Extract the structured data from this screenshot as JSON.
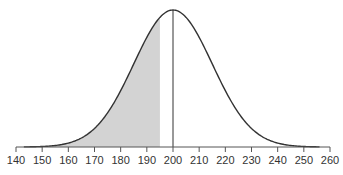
{
  "chart_data": {
    "type": "area",
    "title": "",
    "xlabel": "",
    "ylabel": "",
    "distribution": {
      "name": "normal",
      "mean": 200,
      "sd": 15
    },
    "xlim": [
      140,
      260
    ],
    "x_ticks": [
      140,
      150,
      160,
      170,
      180,
      190,
      200,
      210,
      220,
      230,
      240,
      250,
      260
    ],
    "x_tick_labels": [
      "140",
      "150",
      "160",
      "170",
      "180",
      "190",
      "200",
      "210",
      "220",
      "230",
      "240",
      "250",
      "260"
    ],
    "shaded_region": {
      "from": 143,
      "to": 195,
      "color": "#d3d3d3"
    },
    "vertical_line": {
      "x": 200,
      "color": "#333333"
    },
    "curve_color": "#333333",
    "grid": false,
    "legend": null
  }
}
